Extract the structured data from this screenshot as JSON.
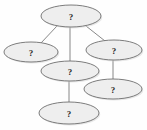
{
  "diagram": {
    "type": "graph",
    "title": "",
    "background_color": "#fefefe",
    "node_fill_color": "#eeeeee",
    "node_stroke_color": "#6e6e6e",
    "edge_color": "#7a7a7a",
    "label_color": "#2b2b2b",
    "node_shape": "ellipse",
    "nodes": [
      {
        "id": "n1",
        "label": "?",
        "cx": 71,
        "cy": 16,
        "rx": 30,
        "ry": 11,
        "role": "root"
      },
      {
        "id": "n2",
        "label": "?",
        "cx": 31,
        "cy": 52,
        "rx": 27,
        "ry": 10,
        "role": "child-left"
      },
      {
        "id": "n3",
        "label": "?",
        "cx": 114,
        "cy": 50,
        "rx": 28,
        "ry": 10,
        "role": "child-right"
      },
      {
        "id": "n4",
        "label": "?",
        "cx": 70,
        "cy": 71,
        "rx": 29,
        "ry": 10,
        "role": "child-center"
      },
      {
        "id": "n5",
        "label": "?",
        "cx": 113,
        "cy": 89,
        "rx": 29,
        "ry": 10,
        "role": "grandchild-right"
      },
      {
        "id": "n6",
        "label": "?",
        "cx": 69,
        "cy": 113,
        "rx": 30,
        "ry": 11,
        "role": "grandchild-center"
      }
    ],
    "edges": [
      {
        "from": "n1",
        "to": "n2",
        "x1": 57,
        "y1": 26,
        "x2": 41,
        "y2": 43
      },
      {
        "from": "n1",
        "to": "n4",
        "x1": 70,
        "y1": 27,
        "x2": 70,
        "y2": 61
      },
      {
        "from": "n1",
        "to": "n3",
        "x1": 86,
        "y1": 26,
        "x2": 105,
        "y2": 41
      },
      {
        "from": "n3",
        "to": "n5",
        "x1": 113,
        "y1": 60,
        "x2": 113,
        "y2": 79
      },
      {
        "from": "n4",
        "to": "n6",
        "x1": 69,
        "y1": 81,
        "x2": 69,
        "y2": 102
      }
    ]
  }
}
